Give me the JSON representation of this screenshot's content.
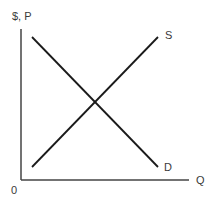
{
  "diagram": {
    "type": "supply-demand",
    "y_axis_label": "$, P",
    "x_axis_label": "Q",
    "origin_label": "0",
    "curves": [
      {
        "name": "S",
        "label": "S",
        "direction": "upward-sloping",
        "from": [
          32,
          167
        ],
        "to": [
          158,
          37
        ]
      },
      {
        "name": "D",
        "label": "D",
        "direction": "downward-sloping",
        "from": [
          32,
          37
        ],
        "to": [
          158,
          167
        ]
      }
    ],
    "equilibrium": {
      "x": 95,
      "y": 102
    },
    "colors": {
      "lines": "#1a1a1a",
      "axes": "#444444",
      "text": "#3a3a3a",
      "background": "#ffffff"
    }
  }
}
